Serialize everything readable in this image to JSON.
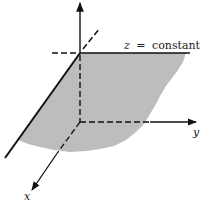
{
  "figure": {
    "plane_label_var": "z",
    "plane_label_eq": "=",
    "plane_label_rest": "constant",
    "axes": {
      "z": {
        "label": ""
      },
      "y": {
        "label": "y"
      },
      "x": {
        "label": "x"
      }
    },
    "colors": {
      "plane_fill": "#b9b9b9",
      "line": "#111111",
      "background": "#ffffff"
    }
  }
}
